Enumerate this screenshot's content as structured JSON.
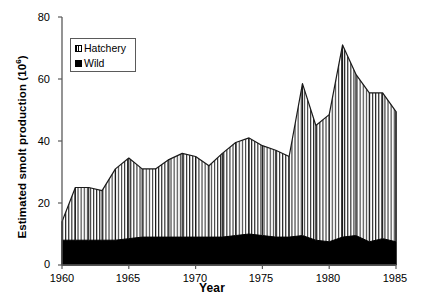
{
  "chart_data": {
    "type": "area",
    "title": "",
    "xlabel": "Year",
    "ylabel": "Estimated smolt production (10⁶)",
    "xlim": [
      1960,
      1985
    ],
    "ylim": [
      0,
      80
    ],
    "grid": false,
    "stacked": true,
    "legend_position": "upper-left-inside",
    "xticks": [
      1960,
      1965,
      1970,
      1975,
      1980,
      1985
    ],
    "yticks": [
      0,
      20,
      40,
      60,
      80
    ],
    "xtick_labels": [
      "1960",
      "1965",
      "1970",
      "1975",
      "1980",
      "1985"
    ],
    "ytick_labels": [
      "0",
      "20",
      "40",
      "60",
      "80"
    ],
    "x": [
      1960,
      1961,
      1962,
      1963,
      1964,
      1965,
      1966,
      1967,
      1968,
      1969,
      1970,
      1971,
      1972,
      1973,
      1974,
      1975,
      1976,
      1977,
      1978,
      1979,
      1980,
      1981,
      1982,
      1983,
      1984,
      1985
    ],
    "series": [
      {
        "name": "Wild",
        "fill": "solid-black",
        "values": [
          8,
          8,
          8,
          8,
          8,
          8.5,
          9,
          9,
          9,
          9,
          9,
          9,
          9,
          9.5,
          10,
          9.5,
          9,
          9,
          9.5,
          8,
          7.5,
          9,
          9.5,
          7.5,
          8.5,
          7.5
        ]
      },
      {
        "name": "Hatchery",
        "fill": "vertical-hatch",
        "values": [
          6,
          17,
          17,
          16,
          23,
          26,
          22,
          22,
          25,
          27,
          26,
          23,
          27,
          30,
          31,
          29,
          28,
          26,
          49,
          37,
          41,
          62,
          52,
          48,
          47,
          42
        ]
      }
    ],
    "totals": [
      14,
      25,
      25,
      24,
      31,
      34.5,
      31,
      31,
      34,
      36,
      35,
      32,
      36,
      39.5,
      41,
      38.5,
      37,
      35,
      58.5,
      45,
      48.5,
      71,
      61.5,
      55.5,
      55.5,
      49.5
    ],
    "legend": [
      {
        "label": "Hatchery",
        "swatch": "hatched-square"
      },
      {
        "label": "Wild",
        "swatch": "filled-black-square"
      }
    ],
    "colors": {
      "wild": "#000000",
      "hatchery_stroke": "#1a1a1a",
      "hatchery_fill": "#ffffff",
      "axis": "#555555",
      "background": "#ffffff"
    }
  },
  "axes": {
    "y_title": "Estimated smolt production (10",
    "y_title_sup": "6",
    "y_title_close": ")",
    "x_title": "Year"
  }
}
